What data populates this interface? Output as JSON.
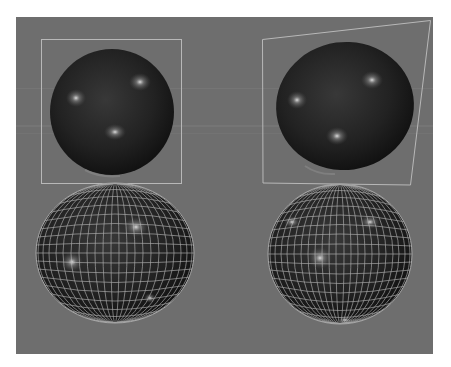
{
  "canvas": {
    "width": 451,
    "height": 367,
    "background": "#ffffff"
  },
  "viewport": {
    "x": 16,
    "y": 17,
    "width": 417,
    "height": 337,
    "color": "#6e6e6e"
  },
  "colors": {
    "sphere_dark": "#141414",
    "sphere_mid": "#2c2c2c",
    "highlight": "#d8d8d8",
    "frame_line": "#b8b8b8",
    "wire_line": "#bdbdbd"
  },
  "objects": [
    {
      "id": "sphere-top-left",
      "label": "",
      "shading": "smooth",
      "frame": "rectangle"
    },
    {
      "id": "sphere-top-right",
      "label": "",
      "shading": "smooth",
      "frame": "perspective-quad"
    },
    {
      "id": "sphere-bottom-left",
      "label": "",
      "shading": "wireframe-on-shaded"
    },
    {
      "id": "sphere-bottom-right",
      "label": "",
      "shading": "wireframe-on-shaded"
    }
  ]
}
